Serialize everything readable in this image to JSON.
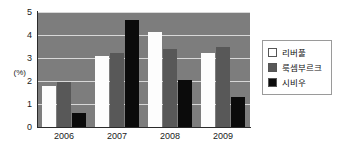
{
  "chart_data": {
    "type": "bar",
    "title": "",
    "xlabel": "",
    "ylabel": "(%)",
    "ylim": [
      0,
      5
    ],
    "yticks": [
      "0",
      "1",
      "2",
      "3",
      "4",
      "5"
    ],
    "grid": true,
    "legend_position": "right",
    "categories": [
      "2006",
      "2007",
      "2008",
      "2009"
    ],
    "series": [
      {
        "name": "리버풀",
        "color": "#ffffff",
        "values": [
          1.8,
          3.1,
          4.15,
          3.2
        ]
      },
      {
        "name": "룩셈부르크",
        "color": "#585858",
        "values": [
          1.95,
          3.2,
          3.4,
          3.5
        ]
      },
      {
        "name": "시비우",
        "color": "#0b0b0b",
        "values": [
          0.6,
          4.65,
          2.05,
          1.3
        ]
      }
    ]
  },
  "plot": {
    "background_color": "#7d7d7d",
    "gridline_color": "#d8d8d8",
    "axis_color": "#2b2b2b"
  }
}
